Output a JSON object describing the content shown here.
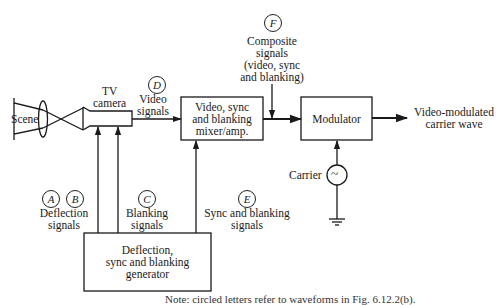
{
  "diagram": {
    "blocks": {
      "mixer": [
        "Video, sync",
        "and blanking",
        "mixer/amp."
      ],
      "modulator": "Modulator",
      "generator": [
        "Deflection,",
        "sync and blanking",
        "generator"
      ]
    },
    "labels": {
      "scene": "Scene",
      "tv_camera": [
        "TV",
        "camera"
      ],
      "video_signals": [
        "Video",
        "signals"
      ],
      "composite": [
        "Composite",
        "signals",
        "(video, sync",
        "and blanking)"
      ],
      "output": [
        "Video-modulated",
        "carrier wave"
      ],
      "carrier": "Carrier",
      "carrier_symbol": "~",
      "deflection_signals": [
        "Deflection",
        "signals"
      ],
      "blanking_signals": [
        "Blanking",
        "signals"
      ],
      "sync_blanking_signals": [
        "Sync and blanking",
        "signals"
      ]
    },
    "markers": {
      "A": "A",
      "B": "B",
      "C": "C",
      "D": "D",
      "E": "E",
      "F": "F"
    },
    "caption": "Note: circled letters refer to waveforms in Fig. 6.12.2(b)."
  }
}
